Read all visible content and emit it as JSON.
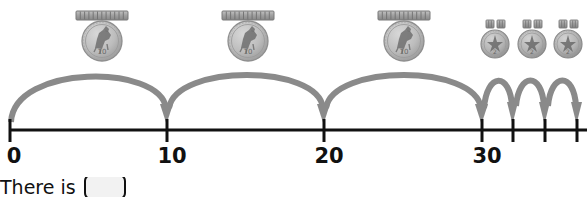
{
  "worksheet": {
    "question_prefix": "There is",
    "answer_value": ""
  },
  "numberline": {
    "axis_color": "#111111",
    "x_start": 10,
    "x_end": 579,
    "y": 130,
    "unit_px": 15.73,
    "ticks": [
      {
        "value": 0,
        "x": 10,
        "label": "0",
        "labeled": true
      },
      {
        "value": 10,
        "x": 167,
        "label": "10",
        "labeled": true
      },
      {
        "value": 20,
        "x": 324,
        "label": "20",
        "labeled": true
      },
      {
        "value": 30,
        "x": 482,
        "label": "30",
        "labeled": true
      },
      {
        "value": 32,
        "x": 513,
        "label": "",
        "labeled": false
      },
      {
        "value": 34,
        "x": 545,
        "label": "",
        "labeled": false
      },
      {
        "value": 36,
        "x": 577,
        "label": "",
        "labeled": false
      }
    ]
  },
  "jumps": {
    "arc_color": "#8a8a8a",
    "big": [
      {
        "from": 0,
        "to": 10,
        "x1": 10,
        "x2": 167,
        "apex_y": 63,
        "size": 10
      },
      {
        "from": 10,
        "to": 20,
        "x1": 167,
        "x2": 324,
        "apex_y": 63,
        "size": 10
      },
      {
        "from": 20,
        "to": 30,
        "x1": 324,
        "x2": 482,
        "apex_y": 63,
        "size": 10
      },
      {
        "from": 30,
        "to": 32,
        "x1": 466,
        "x2": 513,
        "apex_y": 70,
        "size": 10
      }
    ],
    "small": [
      {
        "from": 32,
        "to": 34,
        "x1": 482,
        "x2": 513,
        "apex_y": 72,
        "size": 1
      },
      {
        "from": 34,
        "to": 36,
        "x1": 513,
        "x2": 545,
        "apex_y": 72,
        "size": 1
      },
      {
        "from": 36,
        "to": 38,
        "x1": 545,
        "x2": 577,
        "apex_y": 72,
        "size": 1
      }
    ]
  },
  "money": {
    "large_coins": [
      {
        "label": "ten-unit-coin",
        "cx": 102,
        "cy": 41,
        "r": 20,
        "roll_x": 76,
        "roll_y": 11,
        "roll_w": 52,
        "roll_h": 9,
        "segments": 12
      },
      {
        "label": "ten-unit-coin",
        "cx": 248,
        "cy": 41,
        "r": 20,
        "roll_x": 222,
        "roll_y": 11,
        "roll_w": 52,
        "roll_h": 9,
        "segments": 12
      },
      {
        "label": "ten-unit-coin",
        "cx": 404,
        "cy": 41,
        "r": 20,
        "roll_x": 378,
        "roll_y": 11,
        "roll_w": 52,
        "roll_h": 9,
        "segments": 12
      }
    ],
    "small_coins": [
      {
        "label": "one-unit-coin",
        "cx": 494,
        "cy": 44,
        "r": 14,
        "token_y": 20,
        "token_w": 8,
        "token_h": 8,
        "token_gap": 5,
        "tokens": 2
      },
      {
        "label": "one-unit-coin",
        "cx": 531,
        "cy": 44,
        "r": 14,
        "token_y": 20,
        "token_w": 8,
        "token_h": 8,
        "token_gap": 5,
        "tokens": 2
      },
      {
        "label": "one-unit-coin",
        "cx": 567,
        "cy": 44,
        "r": 14,
        "token_y": 20,
        "token_w": 8,
        "token_h": 8,
        "token_gap": 5,
        "tokens": 2
      }
    ],
    "coin_face_color": "#b9b9b9",
    "coin_edge_color": "#8e8e8e",
    "roll_color": "#9a9a9a"
  }
}
